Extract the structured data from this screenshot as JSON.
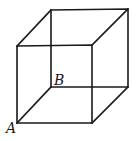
{
  "diagram": {
    "type": "cube-wireframe",
    "labels": {
      "A": "A",
      "B": "B"
    },
    "vertices": {
      "front_top_left": [
        17,
        46
      ],
      "front_top_right": [
        92,
        45
      ],
      "front_bottom_left": [
        17,
        123
      ],
      "front_bottom_right": [
        92,
        123
      ],
      "back_top_left": [
        51,
        10
      ],
      "back_top_right": [
        128,
        9
      ],
      "back_bottom_left": [
        51,
        87
      ],
      "back_bottom_right": [
        128,
        87
      ]
    },
    "label_positions": {
      "A": [
        6,
        133
      ],
      "B": [
        54,
        85
      ]
    },
    "stroke_color": "#1a1a1a"
  }
}
